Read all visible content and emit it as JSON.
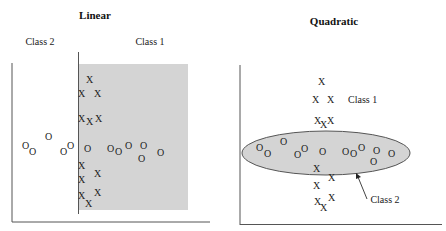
{
  "panels": [
    {
      "title": "Linear",
      "labels": {
        "left_class": "Class 2",
        "right_class": "Class 1"
      },
      "x_marker": "X",
      "o_marker": "O",
      "colors": {
        "region_fill": "#d4d4d4",
        "axis": "#555555"
      }
    },
    {
      "title": "Quadratic",
      "labels": {
        "class1": "Class 1",
        "class2": "Class 2"
      },
      "x_marker": "X",
      "o_marker": "O",
      "colors": {
        "ellipse_fill": "#d4d4d4",
        "ellipse_stroke": "#555555",
        "axis": "#555555"
      }
    }
  ]
}
